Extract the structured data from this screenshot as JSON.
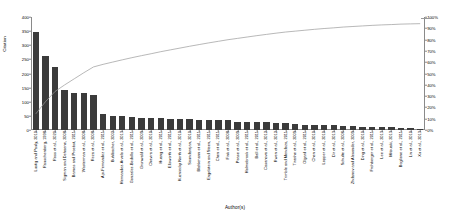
{
  "chart_data": {
    "type": "bar",
    "title": "",
    "xlabel": "Author(s)",
    "ylabel": "Citation",
    "y2label": "Cumulative %",
    "ylim": [
      0,
      400
    ],
    "y2lim": [
      0,
      100
    ],
    "grid": false,
    "legend_position": "none",
    "bar_color": "#3b3b3b",
    "line_color": "#9a9a9a",
    "yticks": [
      0,
      50,
      100,
      150,
      200,
      250,
      300,
      350,
      400
    ],
    "ytick_labels": [
      "0",
      "50",
      "100",
      "150",
      "200",
      "250",
      "300",
      "350",
      "400"
    ],
    "y2ticks": [
      0,
      10,
      20,
      30,
      40,
      50,
      60,
      70,
      80,
      90,
      100
    ],
    "y2tick_labels": [
      "0%",
      "10%",
      "20%",
      "30%",
      "40%",
      "50%",
      "60%",
      "70%",
      "80%",
      "90%",
      "100%"
    ],
    "categories": [
      "Lustig and Pauly, 2010",
      "Rauschenberg, 1998",
      "Ross et al., 2020",
      "Sigman and Dehaene, 2008",
      "Barnes and Proebst, 2011",
      "Westerman et al., 2008",
      "Reza et al., 2008",
      "Ajo-Fernandez et al., 2011",
      "Buhlbacher, 2002",
      "Hernandez-Arvelo et al., 2013",
      "Gonzalez-Bedolla et al., 2011",
      "Grunwald et al., 2009",
      "Chavira et al., 2010",
      "Huang et al., 2011",
      "Ellsworth et al., 2011",
      "Kuzniecky North et al., 2010",
      "Soundarajan, 2010",
      "Blahkmann et al., 2011",
      "Engelstein and Steen, 2011",
      "Chen et al., 2011",
      "Fink et al., 2008",
      "Pease et al., 2009",
      "Holmebrook et al., 2011",
      "Ball et al., 2011",
      "Casanova et al., 2012",
      "Rwen et al., 2012",
      "Trimble and Mendoza, 2011",
      "Tiranhe et al., 2009",
      "Olgard et al., 2011",
      "Chen et al., 2010",
      "Lopper et al., 2010",
      "Dir et al., 2013",
      "Schulte et al., 2006",
      "Zhdanov and Alexander, 2009",
      "Ding et al., 2010",
      "Frohberger et al., 2011",
      "Lee et al., 2013",
      "Mitsuaki, 2013",
      "Boglione et al., 2011",
      "Lin et al., 2010",
      "Xu et al., 2013"
    ],
    "values": [
      348,
      262,
      222,
      142,
      132,
      131,
      125,
      55,
      50,
      48,
      46,
      44,
      43,
      42,
      40,
      39,
      38,
      37,
      36,
      35,
      34,
      30,
      29,
      28,
      27,
      26,
      25,
      20,
      19,
      18,
      17,
      16,
      15,
      14,
      12,
      11,
      10,
      9,
      8,
      6,
      4
    ],
    "cumulative_percent": [
      14.3,
      25.0,
      34.1,
      39.9,
      45.3,
      50.7,
      55.8,
      58.1,
      60.1,
      62.1,
      64.0,
      65.8,
      67.5,
      69.3,
      70.9,
      72.5,
      74.1,
      75.6,
      77.1,
      78.5,
      79.9,
      81.1,
      82.3,
      83.5,
      84.6,
      85.7,
      86.7,
      87.5,
      88.3,
      89.1,
      89.8,
      90.4,
      91.1,
      91.6,
      92.1,
      92.6,
      93.0,
      93.3,
      93.7,
      93.9,
      94.1
    ]
  }
}
